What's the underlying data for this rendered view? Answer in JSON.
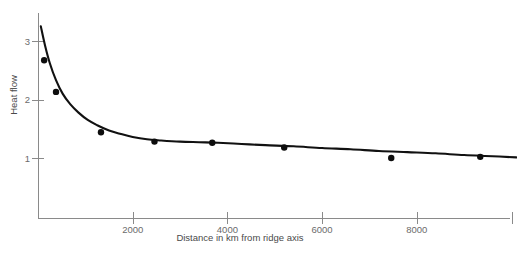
{
  "chart_data": {
    "type": "scatter",
    "title": "",
    "xlabel": "Distance in km from ridge axis",
    "ylabel": "Heat flow",
    "xlim": [
      0,
      10150
    ],
    "ylim": [
      0,
      3.5
    ],
    "grid": false,
    "legend": "none",
    "x_ticks": [
      {
        "value": 2000,
        "label": "2000"
      },
      {
        "value": 4000,
        "label": "4000"
      },
      {
        "value": 6000,
        "label": "6000"
      },
      {
        "value": 8000,
        "label": "8000"
      },
      {
        "value": 10000,
        "label": ""
      }
    ],
    "y_ticks": [
      {
        "value": 1,
        "label": "1"
      },
      {
        "value": 2,
        "label": "2"
      },
      {
        "value": 3,
        "label": "3"
      }
    ],
    "points": [
      {
        "x": 130,
        "y": 2.67
      },
      {
        "x": 380,
        "y": 2.13
      },
      {
        "x": 1330,
        "y": 1.44
      },
      {
        "x": 2460,
        "y": 1.28
      },
      {
        "x": 3680,
        "y": 1.26
      },
      {
        "x": 5200,
        "y": 1.18
      },
      {
        "x": 7460,
        "y": 1.0
      },
      {
        "x": 9340,
        "y": 1.02
      }
    ],
    "series": [
      {
        "name": "fitted heat flow curve",
        "x": [
          60,
          150,
          250,
          380,
          520,
          680,
          850,
          1050,
          1250,
          1500,
          1750,
          2000,
          2300,
          2600,
          3000,
          3400,
          3800,
          4300,
          4800,
          5400,
          6000,
          6600,
          7200,
          7800,
          8400,
          9000,
          9600,
          10100
        ],
        "y": [
          3.25,
          2.92,
          2.62,
          2.33,
          2.1,
          1.92,
          1.78,
          1.65,
          1.56,
          1.47,
          1.41,
          1.36,
          1.32,
          1.3,
          1.28,
          1.27,
          1.26,
          1.24,
          1.22,
          1.2,
          1.17,
          1.15,
          1.12,
          1.1,
          1.08,
          1.05,
          1.03,
          1.01
        ]
      }
    ],
    "marker_radius": 3.2,
    "colors": {
      "curve": "#111111",
      "marker": "#0d0d0d",
      "axis": "#8a8a8a",
      "tick_label": "#6b6b6b",
      "axis_title": "#4a4a4a",
      "background": "#ffffff"
    }
  },
  "geometry": {
    "plot_left": 38,
    "plot_right": 503,
    "plot_top": 13,
    "plot_bottom": 218,
    "y_value_1_px": 158,
    "y_unit_px": 58.5,
    "x_origin_px": 38,
    "x_per_2000km_px": 94.7
  }
}
